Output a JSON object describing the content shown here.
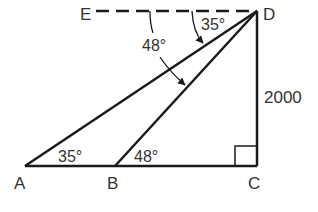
{
  "diagram": {
    "type": "geometry",
    "points": {
      "A": {
        "label": "A",
        "x": 25,
        "y": 166
      },
      "B": {
        "label": "B",
        "x": 115,
        "y": 166
      },
      "C": {
        "label": "C",
        "x": 257,
        "y": 166
      },
      "D": {
        "label": "D",
        "x": 257,
        "y": 11
      },
      "E": {
        "label": "E",
        "x": 96,
        "y": 11
      }
    },
    "segments": [
      {
        "from": "A",
        "to": "C",
        "style": "solid"
      },
      {
        "from": "C",
        "to": "D",
        "style": "solid"
      },
      {
        "from": "A",
        "to": "D",
        "style": "solid"
      },
      {
        "from": "B",
        "to": "D",
        "style": "solid"
      },
      {
        "from": "E",
        "to": "D",
        "style": "dashed"
      }
    ],
    "angles": [
      {
        "id": "angle-A",
        "label": "35°",
        "at": "A"
      },
      {
        "id": "angle-B",
        "label": "48°",
        "at": "B"
      },
      {
        "id": "angle-EDA",
        "label": "35°",
        "at": "D",
        "between": [
          "E",
          "A"
        ]
      },
      {
        "id": "angle-EDB",
        "label": "48°",
        "at": "D",
        "between": [
          "E",
          "B"
        ]
      },
      {
        "id": "angle-C",
        "label": "right angle",
        "at": "C"
      }
    ],
    "side_labels": {
      "CD": "2000"
    },
    "colors": {
      "stroke": "#1a1a1a",
      "text": "#333333",
      "background": "#ffffff"
    }
  }
}
